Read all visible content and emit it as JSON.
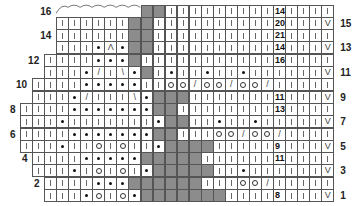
{
  "chart": {
    "type": "knitting-chart",
    "columns": 26,
    "rows": 16,
    "legend_symbols": {
      "|": "knit",
      "•": "purl",
      "O": "yarn-over",
      "/": "k2tog",
      "\\": "ssk",
      "Λ": "double-decrease",
      "V": "slip-stitch",
      "G": "no-stitch (gray)"
    },
    "left_labels": [
      {
        "row": 16,
        "text": "16"
      },
      {
        "row": 14,
        "text": "14"
      },
      {
        "row": 12,
        "text": "12"
      },
      {
        "row": 10,
        "text": "10"
      },
      {
        "row": 8,
        "text": "8"
      },
      {
        "row": 6,
        "text": "6"
      },
      {
        "row": 4,
        "text": "4"
      },
      {
        "row": 2,
        "text": "2"
      }
    ],
    "right_labels": [
      {
        "row": 15,
        "text": "15"
      },
      {
        "row": 13,
        "text": "13"
      },
      {
        "row": 11,
        "text": "11"
      },
      {
        "row": 9,
        "text": "9"
      },
      {
        "row": 7,
        "text": "7"
      },
      {
        "row": 5,
        "text": "5"
      },
      {
        "row": 3,
        "text": "3"
      },
      {
        "row": 1,
        "text": "1"
      }
    ],
    "bindoff_arc": {
      "row": 16,
      "from_col": 3,
      "to_col": 9
    },
    "grid": [
      {
        "row": 16,
        "start": 10,
        "cells": [
          "G",
          "G",
          "|",
          "|",
          "|",
          "|",
          "|",
          "|",
          "|",
          "|",
          "|",
          "14",
          "|",
          "|",
          "|",
          "|"
        ]
      },
      {
        "row": 15,
        "start": 3,
        "cells": [
          "|",
          "|",
          "|",
          "|",
          "|",
          "|",
          "G",
          "G",
          "|",
          "|",
          "|",
          "|",
          "|",
          "|",
          "|",
          "|",
          "|",
          "|",
          "20",
          "|",
          "|",
          "|",
          "V"
        ]
      },
      {
        "row": 14,
        "start": 3,
        "cells": [
          "|",
          "|",
          "|",
          "|",
          "|",
          "|",
          "G",
          "G",
          "|",
          "|",
          "|",
          "|",
          "|",
          "|",
          "|",
          "|",
          "|",
          "|",
          "21",
          "|",
          "|",
          "|",
          "|"
        ]
      },
      {
        "row": 13,
        "start": 3,
        "cells": [
          "|",
          "|",
          "|",
          "•",
          "Λ",
          "•",
          "G",
          "G",
          "|",
          "|",
          "|",
          "|",
          "|",
          "|",
          "|",
          "|",
          "|",
          "|",
          "14",
          "|",
          "|",
          "|",
          "V"
        ]
      },
      {
        "row": 12,
        "start": 2,
        "cells": [
          "|",
          "|",
          "|",
          "|",
          "•",
          "•",
          "•",
          "G",
          "|",
          "|",
          "|",
          "|",
          "|",
          "|",
          "|",
          "|",
          "|",
          "|",
          "|",
          "16",
          "|",
          "|",
          "|",
          "|"
        ]
      },
      {
        "row": 11,
        "start": 2,
        "cells": [
          "|",
          "|",
          "|",
          "•",
          "/",
          "|",
          "\\",
          "•",
          "G",
          "|",
          "•",
          "|",
          "|",
          "•",
          "|",
          "|",
          "•",
          "|",
          "|",
          "|",
          "|",
          "|",
          "|",
          "V"
        ]
      },
      {
        "row": 10,
        "start": 1,
        "cells": [
          "|",
          "|",
          "|",
          "|",
          "•",
          "•",
          "•",
          "•",
          "•",
          "|",
          "|",
          "O",
          "O",
          "/",
          "O",
          "O",
          "/",
          "O",
          "O",
          "/",
          "|",
          "|",
          "|",
          "|",
          "|"
        ]
      },
      {
        "row": 9,
        "start": 1,
        "cells": [
          "|",
          "|",
          "|",
          "•",
          "/",
          "|",
          "|",
          "|",
          "\\",
          "•",
          "G",
          "G",
          "G",
          "|",
          "|",
          "|",
          "|",
          "|",
          "|",
          "|",
          "11",
          "|",
          "|",
          "|",
          "V"
        ]
      },
      {
        "row": 8,
        "start": 0,
        "cells": [
          "|",
          "|",
          "|",
          "|",
          "•",
          "•",
          "•",
          "•",
          "•",
          "•",
          "•",
          "G",
          "G",
          "|",
          "|",
          "|",
          "|",
          "|",
          "|",
          "|",
          "|",
          "13",
          "|",
          "|",
          "|",
          "|"
        ]
      },
      {
        "row": 7,
        "start": 0,
        "cells": [
          "|",
          "|",
          "|",
          "•",
          "|",
          "|",
          "|",
          "|",
          "|",
          "|",
          "|",
          "•",
          "G",
          "G",
          "|",
          "|",
          "•",
          "|",
          "|",
          "•",
          "|",
          "|",
          "|",
          "|",
          "|",
          "V"
        ]
      },
      {
        "row": 6,
        "start": 0,
        "cells": [
          "|",
          "|",
          "|",
          "|",
          "•",
          "•",
          "•",
          "•",
          "•",
          "•",
          "•",
          "G",
          "G",
          "|",
          "|",
          "|",
          "O",
          "O",
          "/",
          "O",
          "O",
          "/",
          "|",
          "|",
          "|",
          "|"
        ]
      },
      {
        "row": 5,
        "start": 0,
        "cells": [
          "|",
          "|",
          "|",
          "•",
          "|",
          "|",
          "O",
          "|",
          "O",
          "|",
          "|",
          "•",
          "G",
          "G",
          "G",
          "G",
          "|",
          "|",
          "|",
          "|",
          "|",
          "9",
          "|",
          "|",
          "|",
          "V"
        ]
      },
      {
        "row": 4,
        "start": 1,
        "cells": [
          "|",
          "|",
          "|",
          "|",
          "•",
          "•",
          "•",
          "•",
          "•",
          "G",
          "G",
          "G",
          "G",
          "G",
          "|",
          "|",
          "|",
          "|",
          "|",
          "|",
          "11",
          "|",
          "|",
          "|",
          "|"
        ]
      },
      {
        "row": 3,
        "start": 1,
        "cells": [
          "|",
          "|",
          "|",
          "•",
          "|",
          "O",
          "|",
          "O",
          "|",
          "•",
          "G",
          "G",
          "G",
          "G",
          "G",
          "|",
          "|",
          "•",
          "|",
          "|",
          "|",
          "|",
          "|",
          "|",
          "V"
        ]
      },
      {
        "row": 2,
        "start": 2,
        "cells": [
          "|",
          "|",
          "|",
          "|",
          "•",
          "•",
          "•",
          "G",
          "G",
          "G",
          "G",
          "G",
          "G",
          "|",
          "|",
          "|",
          "O",
          "O",
          "/",
          "|",
          "|",
          "|",
          "|",
          "|"
        ]
      },
      {
        "row": 1,
        "start": 2,
        "cells": [
          "|",
          "|",
          "|",
          "•",
          "O",
          "|",
          "O",
          "•",
          "G",
          "G",
          "G",
          "G",
          "G",
          "G",
          "G",
          "|",
          "|",
          "|",
          "|",
          "8",
          "|",
          "|",
          "|",
          "V"
        ]
      }
    ]
  }
}
